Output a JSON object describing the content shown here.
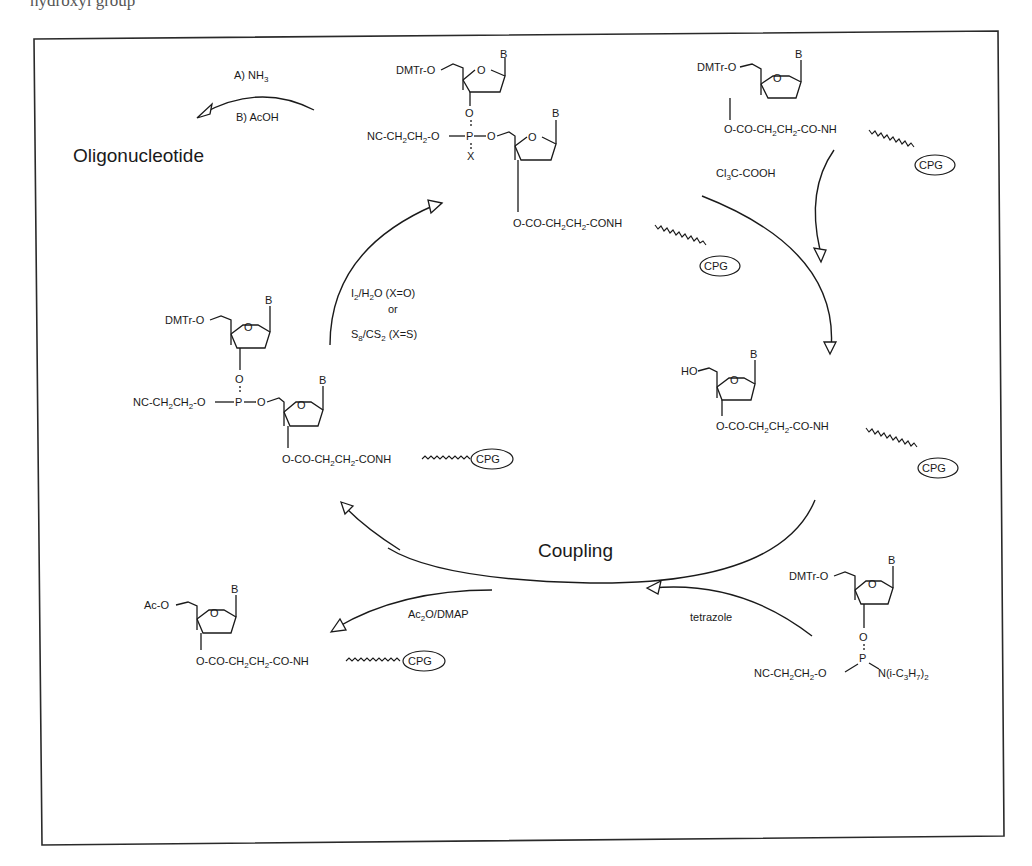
{
  "figure": {
    "title_fragment": "hydroxyl group",
    "frame": {
      "border_color": "#2a2a2a",
      "background": "#ffffff"
    }
  },
  "deprotection": {
    "reagent_a": "A) NH",
    "reagent_a_sub": "3",
    "reagent_b": "B) AcOH",
    "product": "Oligonucleotide"
  },
  "oxidation": {
    "reagent_1": "I",
    "reagent_1_sub1": "2",
    "reagent_1_mid": "/H",
    "reagent_1_sub2": "2",
    "reagent_1_tail": "O (X=O)",
    "or": "or",
    "reagent_2": "S",
    "reagent_2_sub1": "8",
    "reagent_2_mid": "/CS",
    "reagent_2_sub2": "2",
    "reagent_2_tail": "(X=S)"
  },
  "detritylation": {
    "reagent": "Cl",
    "reagent_sub": "3",
    "reagent_tail": "C-COOH"
  },
  "coupling": {
    "label": "Coupling",
    "activator": "tetrazole"
  },
  "capping": {
    "reagent": "Ac",
    "reagent_sub": "2",
    "reagent_tail": "O/DMAP"
  },
  "structures": {
    "common": {
      "base": "B",
      "ring_o": "O",
      "dmtr": "DMTr-O",
      "linker_start": "O-CO-CH",
      "linker_sub": "2",
      "linker_mid": "CH",
      "linker_tail_conh": "-CONH",
      "linker_tail_co_nh": "-CO-NH",
      "support": "CPG",
      "cyanoethyl": "NC-CH",
      "cyanoethyl_mid": "CH",
      "cyanoethyl_tail": "-O",
      "phosphorus": "P",
      "bridge_o": "O",
      "x": "X"
    },
    "start_nucleoside": {
      "protecting": "DMTr-O"
    },
    "detritylated": {
      "hydroxyl": "HO"
    },
    "phosphoramidite": {
      "amine": "N(i-C",
      "amine_sub1": "3",
      "amine_h": "H",
      "amine_sub2": "7",
      "amine_tail": ")",
      "amine_sub3": "2"
    },
    "capped": {
      "acetyl": "Ac-O"
    }
  }
}
